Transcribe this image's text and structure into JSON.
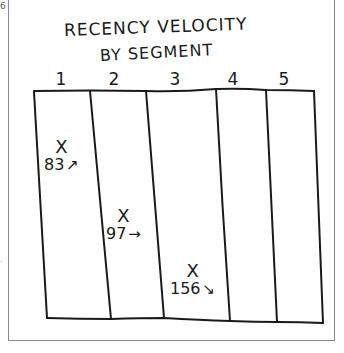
{
  "edge_marks": {
    "top_left": "6",
    "mid_left": "·"
  },
  "title": {
    "line1": "RECENCY VELOCITY",
    "line2": "BY SEGMENT"
  },
  "columns": [
    {
      "label": "1"
    },
    {
      "label": "2"
    },
    {
      "label": "3"
    },
    {
      "label": "4"
    },
    {
      "label": "5"
    }
  ],
  "markers": [
    {
      "column": "1",
      "symbol": "X",
      "value": "83",
      "trend": "up",
      "arrow": "↗"
    },
    {
      "column": "2",
      "symbol": "X",
      "value": "97",
      "trend": "flat",
      "arrow": "→"
    },
    {
      "column": "3",
      "symbol": "X",
      "value": "156",
      "trend": "down",
      "arrow": "↘"
    }
  ],
  "colors": {
    "ink": "#1a1a1a",
    "frame": "#8a8a8a",
    "background": "#ffffff"
  }
}
